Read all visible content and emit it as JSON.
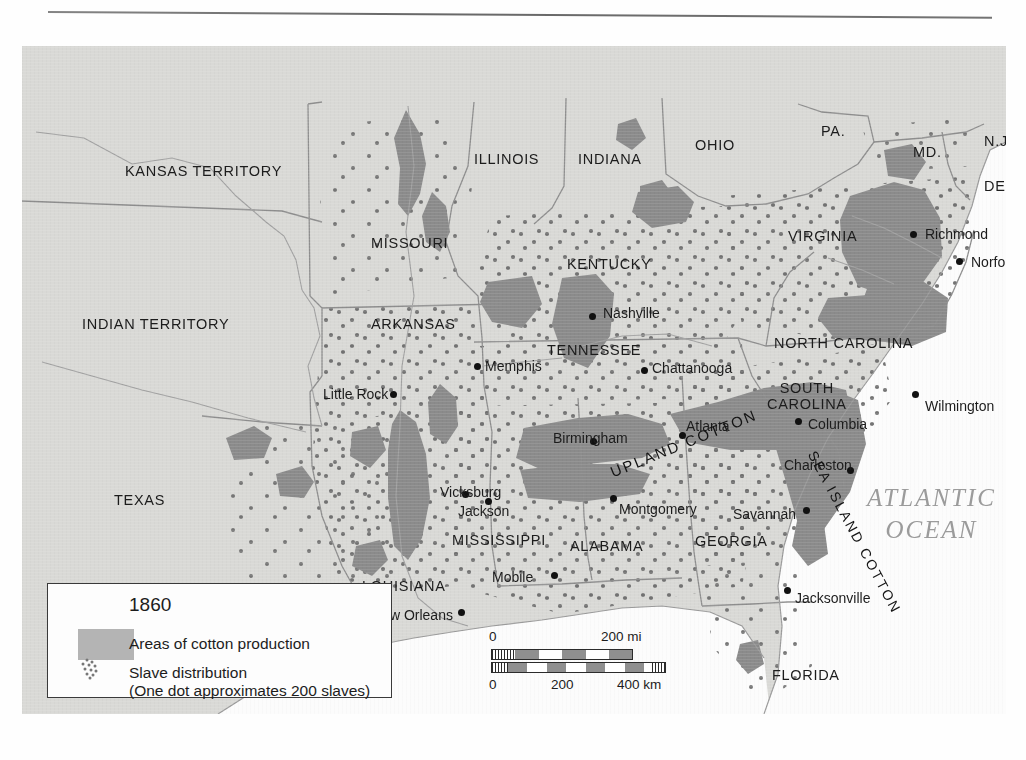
{
  "map": {
    "title_context": "Cotton production and slave distribution in the American South, 1860",
    "ocean_label": "ATLANTIC\nOCEAN",
    "ocean_label_line1": "ATLANTIC",
    "ocean_label_line2": "OCEAN",
    "cotton_regions": [
      {
        "name": "UPLAND COTTON",
        "rotation": -22
      },
      {
        "name": "SEA ISLAND COTTON",
        "rotation": 62
      }
    ],
    "states": [
      {
        "label": "KANSAS TERRITORY",
        "x": 103,
        "y": 118,
        "size": "normal"
      },
      {
        "label": "MISSOURI",
        "x": 349,
        "y": 190,
        "size": "normal"
      },
      {
        "label": "INDIAN TERRITORY",
        "x": 60,
        "y": 271,
        "size": "normal"
      },
      {
        "label": "ARKANSAS",
        "x": 349,
        "y": 271,
        "size": "normal"
      },
      {
        "label": "ILLINOIS",
        "x": 452,
        "y": 106,
        "size": "normal"
      },
      {
        "label": "INDIANA",
        "x": 556,
        "y": 106,
        "size": "normal"
      },
      {
        "label": "OHIO",
        "x": 673,
        "y": 92,
        "size": "normal"
      },
      {
        "label": "PA.",
        "x": 799,
        "y": 78,
        "size": "normal"
      },
      {
        "label": "MD.",
        "x": 891,
        "y": 99,
        "size": "normal"
      },
      {
        "label": "N.J.",
        "x": 962,
        "y": 88,
        "size": "normal"
      },
      {
        "label": "DEL.",
        "x": 962,
        "y": 133,
        "size": "normal"
      },
      {
        "label": "KENTUCKY",
        "x": 545,
        "y": 211,
        "size": "normal"
      },
      {
        "label": "TENNESSEE",
        "x": 525,
        "y": 297,
        "size": "normal"
      },
      {
        "label": "VIRGINIA",
        "x": 766,
        "y": 183,
        "size": "normal"
      },
      {
        "label": "NORTH CAROLINA",
        "x": 752,
        "y": 290,
        "size": "normal"
      },
      {
        "label": "SOUTH CAROLINA",
        "x": 745,
        "y": 335,
        "size": "two"
      },
      {
        "label": "TEXAS",
        "x": 92,
        "y": 447,
        "size": "normal"
      },
      {
        "label": "LOUISIANA",
        "x": 340,
        "y": 533,
        "size": "normal"
      },
      {
        "label": "MISSISSIPPI",
        "x": 430,
        "y": 487,
        "size": "normal"
      },
      {
        "label": "ALABAMA",
        "x": 548,
        "y": 493,
        "size": "normal"
      },
      {
        "label": "GEORGIA",
        "x": 673,
        "y": 488,
        "size": "normal"
      },
      {
        "label": "FLORIDA",
        "x": 750,
        "y": 622,
        "size": "normal"
      }
    ],
    "cities": [
      {
        "name": "Richmond",
        "dx": 891,
        "dy": 188,
        "lx": 903,
        "ly": 181
      },
      {
        "name": "Norfolk",
        "dx": 937,
        "dy": 215,
        "lx": 949,
        "ly": 209
      },
      {
        "name": "Nashville",
        "dx": 570,
        "dy": 270,
        "lx": 581,
        "ly": 260
      },
      {
        "name": "Memphis",
        "dx": 455,
        "dy": 320,
        "lx": 463,
        "ly": 313
      },
      {
        "name": "Chattanooga",
        "dx": 622,
        "dy": 324,
        "lx": 630,
        "ly": 315
      },
      {
        "name": "Little Rock",
        "dx": 371,
        "dy": 348,
        "lx": 301,
        "ly": 341
      },
      {
        "name": "Wilmington",
        "dx": 893,
        "dy": 348,
        "lx": 903,
        "ly": 353
      },
      {
        "name": "Columbia",
        "dx": 776,
        "dy": 375,
        "lx": 786,
        "ly": 371
      },
      {
        "name": "Atlanta",
        "dx": 660,
        "dy": 389,
        "lx": 664,
        "ly": 373
      },
      {
        "name": "Birmingham",
        "dx": 571,
        "dy": 395,
        "lx": 531,
        "ly": 385
      },
      {
        "name": "Charleston",
        "dx": 828,
        "dy": 424,
        "lx": 762,
        "ly": 412
      },
      {
        "name": "Vicksburg",
        "dx": 443,
        "dy": 448,
        "lx": 418,
        "ly": 439
      },
      {
        "name": "Jackson",
        "dx": 466,
        "dy": 455,
        "lx": 436,
        "ly": 458
      },
      {
        "name": "Montgomery",
        "dx": 591,
        "dy": 452,
        "lx": 597,
        "ly": 456
      },
      {
        "name": "Savannah",
        "dx": 784,
        "dy": 464,
        "lx": 711,
        "ly": 461
      },
      {
        "name": "Mobile",
        "dx": 532,
        "dy": 529,
        "lx": 470,
        "ly": 524
      },
      {
        "name": "Houston",
        "dx": 245,
        "dy": 546,
        "lx": 252,
        "ly": 546
      },
      {
        "name": "New Orleans",
        "dx": 439,
        "dy": 566,
        "lx": 350,
        "ly": 562
      },
      {
        "name": "San Antonio",
        "dx": 118,
        "dy": 559,
        "lx": 126,
        "ly": 564
      },
      {
        "name": "Jacksonville",
        "dx": 765,
        "dy": 544,
        "lx": 773,
        "ly": 545
      }
    ]
  },
  "legend": {
    "year": "1860",
    "cotton_label": "Areas of cotton production",
    "slave_label": "Slave distribution",
    "slave_sublabel": "(One dot approximates 200 slaves)",
    "swatch_color": "#b4b4b4"
  },
  "scale": {
    "miles": {
      "start": "0",
      "end": "200 mi"
    },
    "km": {
      "start": "0",
      "mid": "200",
      "end": "400 km"
    }
  },
  "colors": {
    "land": "#d9d9d6",
    "cotton": "#8b8b8b",
    "ocean": "#fcfcfc",
    "border": "#8e8e8e",
    "dot": "#6d6d6d",
    "text": "#1c1c1c"
  }
}
